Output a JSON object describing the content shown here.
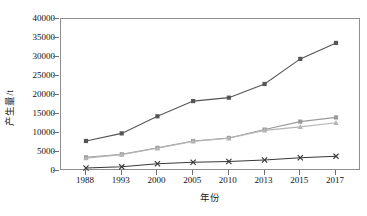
{
  "chart_data": {
    "type": "line",
    "title": "",
    "xlabel": "年份",
    "ylabel": "产生量/t",
    "categories": [
      "1988",
      "1993",
      "2000",
      "2005",
      "2010",
      "2013",
      "2015",
      "2017"
    ],
    "x": [
      1988,
      1993,
      2000,
      2005,
      2010,
      2013,
      2015,
      2017
    ],
    "ylim": [
      0,
      40000
    ],
    "y_ticks": [
      0,
      5000,
      10000,
      15000,
      20000,
      25000,
      30000,
      35000,
      40000
    ],
    "y_tick_labels": [
      "0",
      "5000",
      "10000",
      "15000",
      "20000",
      "25000",
      "30000",
      "35000",
      "40000"
    ],
    "grid": false,
    "legend": "none",
    "series": [
      {
        "name": "series-1",
        "marker": "square",
        "color": "#555555",
        "values": [
          7900,
          9900,
          14400,
          18400,
          19300,
          22900,
          29500,
          33700
        ]
      },
      {
        "name": "series-2",
        "marker": "square",
        "color": "#9a9a9a",
        "values": [
          3600,
          4400,
          6100,
          7900,
          8700,
          10900,
          13000,
          14100
        ]
      },
      {
        "name": "series-3",
        "marker": "triangle",
        "color": "#b5b5b5",
        "values": [
          3400,
          4300,
          6000,
          7800,
          8600,
          10700,
          11600,
          12700
        ]
      },
      {
        "name": "series-4",
        "marker": "cross",
        "color": "#3a3a3a",
        "values": [
          800,
          1100,
          1900,
          2300,
          2500,
          2900,
          3500,
          3900
        ]
      }
    ]
  }
}
